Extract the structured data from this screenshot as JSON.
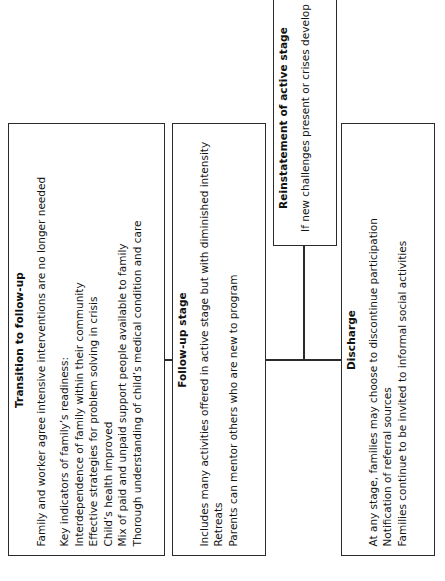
{
  "diagram": {
    "background_color": "#ffffff",
    "line_color": "#2b2b2b",
    "text_color": "#141414",
    "orientation": "text rotated 90 degrees counter-clockwise"
  },
  "nodes": {
    "transition": {
      "title": "Transition to follow-up",
      "lines": [
        "Family and worker agree intensive interventions are no longer needed",
        "Key indicators of family’s readiness:",
        "Interdependence of family within their community",
        "Effective strategies for problem solving in crisis",
        "Child’s health improved",
        "Mix of paid and unpaid support people available to family",
        "Thorough understanding of child’s medical condition and care"
      ]
    },
    "followup": {
      "title": "Follow-up stage",
      "lines": [
        "Includes many activities offered in active stage but with diminished intensity",
        "Retreats",
        "Parents can mentor others who are new to program"
      ]
    },
    "reinstatement": {
      "title": "Reinstatement of active stage",
      "subtitle": "If new challenges present or crises develop"
    },
    "discharge": {
      "title": "Discharge",
      "lines": [
        "At any stage, families may choose to discontinue participation",
        "Notification of referral sources",
        "Families continue to be invited to informal social activities"
      ]
    }
  },
  "connectors": [
    {
      "name": "transition-to-followup",
      "kind": "horizontal-link"
    },
    {
      "name": "followup-to-reinstatement",
      "kind": "branch-link"
    },
    {
      "name": "followup-to-discharge",
      "kind": "branch-link"
    }
  ]
}
